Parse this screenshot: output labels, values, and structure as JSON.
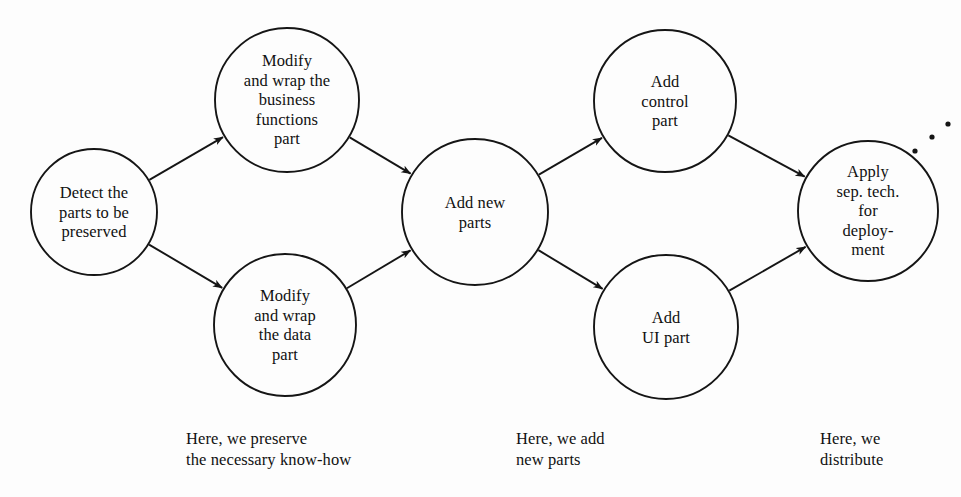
{
  "diagram": {
    "background_color": "#fdfdfd",
    "stroke_color": "#151515",
    "nodes": [
      {
        "id": "detect",
        "label": "Detect the\nparts to be\npreserved",
        "cx": 94,
        "cy": 212,
        "r": 63
      },
      {
        "id": "modify-bus",
        "label": "Modify\nand wrap the\nbusiness\nfunctions\npart",
        "cx": 287,
        "cy": 100,
        "r": 72
      },
      {
        "id": "modify-data",
        "label": "Modify\nand wrap\nthe data\npart",
        "cx": 285,
        "cy": 325,
        "r": 71
      },
      {
        "id": "add-new",
        "label": "Add new\nparts",
        "cx": 475,
        "cy": 212,
        "r": 73
      },
      {
        "id": "add-control",
        "label": "Add\ncontrol\npart",
        "cx": 665,
        "cy": 101,
        "r": 71
      },
      {
        "id": "add-ui",
        "label": "Add\nUI part",
        "cx": 666,
        "cy": 327,
        "r": 72
      },
      {
        "id": "apply-sep",
        "label": "Apply\nsep. tech.\nfor\ndeploy-\nment",
        "cx": 868,
        "cy": 211,
        "r": 70
      }
    ],
    "edges": [
      {
        "from": "detect",
        "to": "modify-bus"
      },
      {
        "from": "detect",
        "to": "modify-data"
      },
      {
        "from": "modify-bus",
        "to": "add-new"
      },
      {
        "from": "modify-data",
        "to": "add-new"
      },
      {
        "from": "add-new",
        "to": "add-control"
      },
      {
        "from": "add-new",
        "to": "add-ui"
      },
      {
        "from": "add-control",
        "to": "apply-sep"
      },
      {
        "from": "add-ui",
        "to": "apply-sep"
      }
    ],
    "ellipsis": {
      "name": "continuation-ellipsis",
      "dots": [
        {
          "cx": 915,
          "cy": 151,
          "r": 2.6
        },
        {
          "cx": 932,
          "cy": 137,
          "r": 2.6
        },
        {
          "cx": 948,
          "cy": 124,
          "r": 2.6
        }
      ]
    },
    "captions": [
      {
        "id": "preserve",
        "text": "Here, we preserve\nthe necessary know-how",
        "x": 186,
        "y": 428
      },
      {
        "id": "add",
        "text": "Here, we add\nnew parts",
        "x": 516,
        "y": 428
      },
      {
        "id": "distribute",
        "text": "Here, we\ndistribute",
        "x": 820,
        "y": 428
      }
    ]
  }
}
